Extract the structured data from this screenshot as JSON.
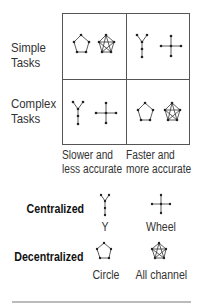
{
  "matrix": {
    "rows": [
      {
        "label_line1": "Simple",
        "label_line2": "Tasks",
        "cells": [
          [
            "circle",
            "all-channel"
          ],
          [
            "y",
            "wheel"
          ]
        ]
      },
      {
        "label_line1": "Complex",
        "label_line2": "Tasks",
        "cells": [
          [
            "y",
            "wheel"
          ],
          [
            "circle",
            "all-channel"
          ]
        ]
      }
    ],
    "columns": [
      {
        "line1": "Slower and",
        "line2": "less accurate"
      },
      {
        "line1": "Faster and",
        "line2": "more accurate"
      }
    ]
  },
  "legend": {
    "centralized": {
      "label": "Centralized",
      "items": [
        {
          "icon": "y-network",
          "name": "Y"
        },
        {
          "icon": "wheel-network",
          "name": "Wheel"
        }
      ]
    },
    "decentralized": {
      "label": "Decentralized",
      "items": [
        {
          "icon": "circle-network",
          "name": "Circle"
        },
        {
          "icon": "all-channel-network",
          "name": "All channel"
        }
      ]
    }
  }
}
